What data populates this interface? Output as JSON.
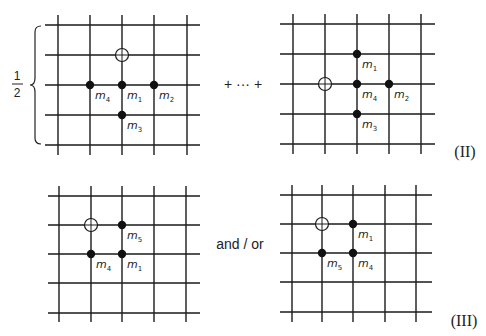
{
  "diagram": {
    "prefactor": {
      "numerator": "1",
      "denominator": "2"
    },
    "connector_top": "+ ··· +",
    "connector_bottom": "and / or",
    "equation_labels": {
      "top": "(II)",
      "bottom": "(III)"
    },
    "colors": {
      "line": "#1a1a1a",
      "site": "#111111",
      "background": "#ffffff"
    },
    "panels": [
      {
        "id": "top-left",
        "xs": [
          58,
          90,
          122,
          154,
          187
        ],
        "ys": [
          25,
          55,
          85,
          115,
          145
        ],
        "x_extent": [
          45,
          200
        ],
        "y_extent": [
          15,
          155
        ],
        "hole": {
          "col": 2,
          "row": 1,
          "symbol": "circle-plus-icon"
        },
        "sites": [
          {
            "col": 1,
            "row": 2,
            "label": "m",
            "sub": "4"
          },
          {
            "col": 2,
            "row": 2,
            "label": "m",
            "sub": "1"
          },
          {
            "col": 3,
            "row": 2,
            "label": "m",
            "sub": "2"
          },
          {
            "col": 2,
            "row": 3,
            "label": "m",
            "sub": "3"
          }
        ]
      },
      {
        "id": "top-right",
        "xs": [
          293,
          325,
          357,
          389,
          421
        ],
        "ys": [
          24,
          54,
          84,
          114,
          144
        ],
        "x_extent": [
          280,
          435
        ],
        "y_extent": [
          14,
          154
        ],
        "hole": {
          "col": 1,
          "row": 2,
          "symbol": "circle-plus-icon"
        },
        "sites": [
          {
            "col": 2,
            "row": 1,
            "label": "m",
            "sub": "1"
          },
          {
            "col": 2,
            "row": 2,
            "label": "m",
            "sub": "4"
          },
          {
            "col": 3,
            "row": 2,
            "label": "m",
            "sub": "2"
          },
          {
            "col": 2,
            "row": 3,
            "label": "m",
            "sub": "3"
          }
        ]
      },
      {
        "id": "bottom-left",
        "xs": [
          59,
          91,
          122,
          154,
          186
        ],
        "ys": [
          196,
          225,
          254,
          283,
          313
        ],
        "x_extent": [
          48,
          200
        ],
        "y_extent": [
          186,
          322
        ],
        "hole": {
          "col": 1,
          "row": 1,
          "symbol": "circle-plus-icon"
        },
        "sites": [
          {
            "col": 2,
            "row": 1,
            "label": "m",
            "sub": "5"
          },
          {
            "col": 1,
            "row": 2,
            "label": "m",
            "sub": "4"
          },
          {
            "col": 2,
            "row": 2,
            "label": "m",
            "sub": "1"
          }
        ]
      },
      {
        "id": "bottom-right",
        "xs": [
          292,
          322,
          353,
          385,
          416
        ],
        "ys": [
          195,
          224,
          253,
          282,
          312
        ],
        "x_extent": [
          280,
          432
        ],
        "y_extent": [
          185,
          322
        ],
        "hole": {
          "col": 1,
          "row": 1,
          "symbol": "circle-plus-icon"
        },
        "sites": [
          {
            "col": 2,
            "row": 1,
            "label": "m",
            "sub": "1"
          },
          {
            "col": 1,
            "row": 2,
            "label": "m",
            "sub": "5"
          },
          {
            "col": 2,
            "row": 2,
            "label": "m",
            "sub": "4"
          }
        ]
      }
    ]
  }
}
